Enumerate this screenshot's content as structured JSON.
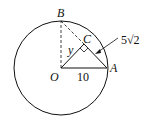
{
  "diagram": {
    "type": "circle-geometry",
    "points": {
      "O": {
        "label": "O",
        "x": 61,
        "y": 68
      },
      "A": {
        "label": "A",
        "x": 107,
        "y": 68
      },
      "B": {
        "label": "B",
        "x": 61,
        "y": 21
      },
      "C": {
        "label": "C",
        "x": 84,
        "y": 44
      }
    },
    "circle": {
      "center": "O",
      "radius": 47
    },
    "segments": [
      {
        "from": "O",
        "to": "A",
        "style": "solid",
        "label": "10"
      },
      {
        "from": "O",
        "to": "B",
        "style": "dashed"
      },
      {
        "from": "B",
        "to": "C",
        "style": "dashed"
      },
      {
        "from": "C",
        "to": "A",
        "style": "solid"
      },
      {
        "from": "O",
        "to": "C",
        "style": "solid",
        "label": "y"
      }
    ],
    "right_angle_at": "C",
    "labels": {
      "B": "B",
      "C": "C",
      "O": "O",
      "A": "A",
      "y": "y",
      "oa_length": "10",
      "ca_length": "5√2"
    },
    "colors": {
      "stroke": "#111111",
      "background": "#ffffff"
    }
  }
}
